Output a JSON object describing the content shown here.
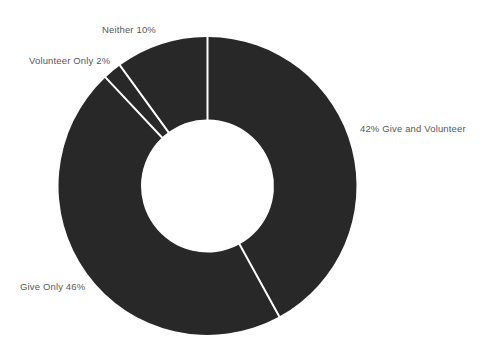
{
  "chart_data": {
    "type": "pie",
    "variant": "donut",
    "title": "",
    "subtitle": "",
    "xlabel": "",
    "ylabel": "",
    "legend": "none",
    "grid": false,
    "units": "percent",
    "total": 100,
    "start_angle_deg": 0,
    "direction": "clockwise",
    "categories": [
      "Give and Volunteer",
      "Give Only",
      "Volunteer Only",
      "Neither"
    ],
    "values": [
      42,
      46,
      2,
      10
    ],
    "slice_color": "#282828",
    "separator_color": "#ffffff",
    "background_color": "#ffffff",
    "label_color": "#56585a",
    "slices": [
      {
        "name": "give-and-volunteer",
        "label": "42% Give and Volunteer",
        "value": 42,
        "start_pct": 0,
        "end_pct": 42,
        "color": "#282828"
      },
      {
        "name": "give-only",
        "label": "Give Only 46%",
        "value": 46,
        "start_pct": 42,
        "end_pct": 88,
        "color": "#282828"
      },
      {
        "name": "volunteer-only",
        "label": "Volunteer Only 2%",
        "value": 2,
        "start_pct": 88,
        "end_pct": 90,
        "color": "#282828"
      },
      {
        "name": "neither",
        "label": "Neither 10%",
        "value": 10,
        "start_pct": 90,
        "end_pct": 100,
        "color": "#282828"
      }
    ],
    "geometry": {
      "center_x": 207.5,
      "center_y": 186,
      "outer_radius": 149,
      "inner_radius": 66.5,
      "separator_width": 2
    }
  }
}
